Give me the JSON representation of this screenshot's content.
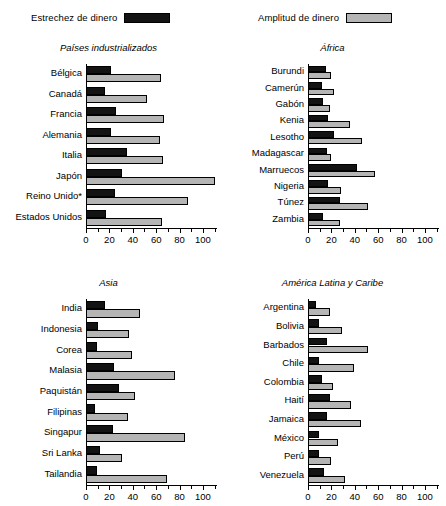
{
  "legend": {
    "items": [
      {
        "label": "Estrechez de dinero",
        "color": "#131313",
        "key": "estrechez"
      },
      {
        "label": "Amplitud de dinero",
        "color": "#b5b5b5",
        "key": "amplitud"
      }
    ]
  },
  "chart_data": {
    "type": "bar",
    "orientation": "horizontal",
    "title": "",
    "xlabel": "",
    "ylabel": "",
    "xlim": [
      0,
      112
    ],
    "grid": false,
    "legend_position": "top",
    "series_names": [
      "Estrechez de dinero",
      "Amplitud de dinero"
    ],
    "tick_labels": [
      "0",
      "20",
      "40",
      "60",
      "80",
      "100"
    ],
    "tick_values": [
      0,
      20,
      40,
      60,
      80,
      100
    ],
    "minor_tick_step": 10,
    "panels": [
      {
        "title": "Países industrializados",
        "categories": [
          "Bélgica",
          "Canadá",
          "Francia",
          "Alemania",
          "Italia",
          "Japón",
          "Reino Unido*",
          "Estados Unidos"
        ],
        "series": [
          {
            "name": "Estrechez de dinero",
            "values": [
              21,
              16,
              26,
              21,
              35,
              31,
              25,
              17
            ]
          },
          {
            "name": "Amplitud de dinero",
            "values": [
              64,
              52,
              67,
              63,
              66,
              110,
              87,
              65
            ]
          }
        ]
      },
      {
        "title": "África",
        "categories": [
          "Burundi",
          "Camerún",
          "Gabón",
          "Kenia",
          "Lesotho",
          "Madagascar",
          "Marruecos",
          "Nigeria",
          "Túnez",
          "Zambia"
        ],
        "series": [
          {
            "name": "Estrechez de dinero",
            "values": [
              15,
              12,
              13,
              17,
              22,
              16,
              42,
              17,
              27,
              13
            ]
          },
          {
            "name": "Amplitud de dinero",
            "values": [
              20,
              22,
              19,
              36,
              46,
              20,
              57,
              28,
              51,
              27
            ]
          }
        ]
      },
      {
        "title": "Asia",
        "categories": [
          "India",
          "Indonesia",
          "Corea",
          "Malasia",
          "Paquistán",
          "Filipinas",
          "Singapur",
          "Sri Lanka",
          "Tailandia"
        ],
        "series": [
          {
            "name": "Estrechez de dinero",
            "values": [
              16,
              10,
              9,
              24,
              28,
              8,
              23,
              12,
              9
            ]
          },
          {
            "name": "Amplitud de dinero",
            "values": [
              46,
              37,
              39,
              76,
              42,
              36,
              85,
              31,
              69
            ]
          }
        ]
      },
      {
        "title": "América Latina y Caribe",
        "categories": [
          "Argentina",
          "Bolivia",
          "Barbados",
          "Chile",
          "Colombia",
          "Haití",
          "Jamaica",
          "México",
          "Perú",
          "Venezuela"
        ],
        "series": [
          {
            "name": "Estrechez de dinero",
            "values": [
              7,
              9,
              16,
              9,
              12,
              19,
              16,
              9,
              9,
              14
            ]
          },
          {
            "name": "Amplitud de dinero",
            "values": [
              19,
              29,
              51,
              39,
              21,
              37,
              45,
              26,
              20,
              32
            ]
          }
        ]
      }
    ]
  }
}
